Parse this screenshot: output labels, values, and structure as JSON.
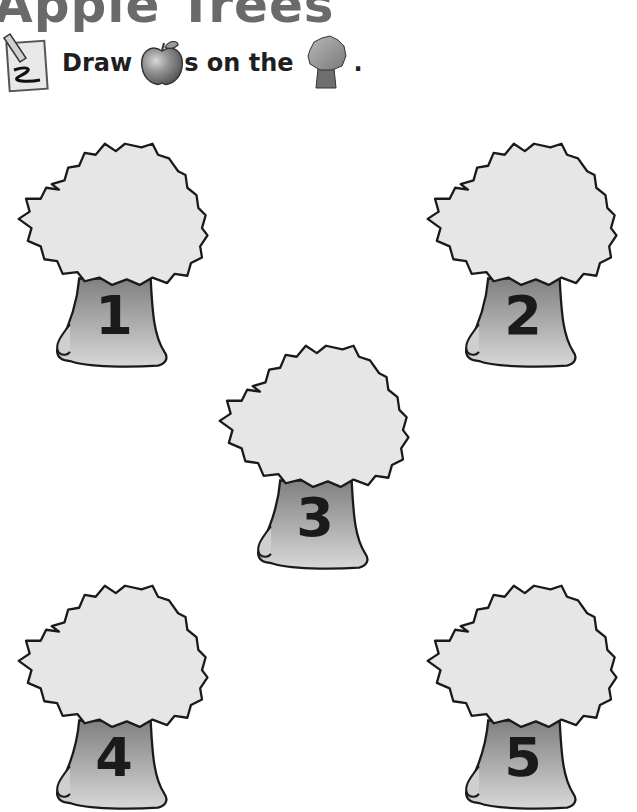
{
  "page": {
    "title": "Apple Trees",
    "instruction": {
      "word1": "Draw",
      "word2": "s on the",
      "word3": ".",
      "icons": [
        "pencil-writing-icon",
        "apple-icon",
        "tree-icon"
      ]
    }
  },
  "trees": [
    {
      "number": "1"
    },
    {
      "number": "2"
    },
    {
      "number": "3"
    },
    {
      "number": "4"
    },
    {
      "number": "5"
    }
  ],
  "colors": {
    "canopy": "#e6e6e6",
    "trunk_top": "#8c8c8c",
    "trunk_bottom": "#d4d4d4",
    "outline": "#1a1a1a",
    "title": "#6a6a6a"
  }
}
